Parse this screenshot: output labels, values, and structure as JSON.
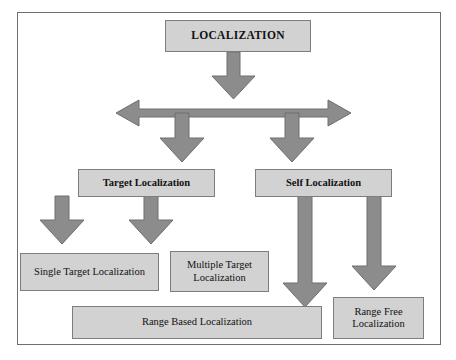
{
  "figure": {
    "frame_border_color": "#6f6f6f",
    "node_fill_color": "#d2d2d2",
    "node_border_color": "#7d7d7d",
    "arrow_fill_color": "#8c8c8c",
    "arrow_stroke_color": "#6e6e6e",
    "background_color": "#ffffff"
  },
  "nodes": {
    "root": {
      "label": "LOCALIZATION"
    },
    "target_localization": {
      "label": "Target Localization"
    },
    "self_localization": {
      "label": "Self Localization"
    },
    "single_target_localization": {
      "label": "Single Target Localization"
    },
    "multiple_target_localization": {
      "label": "Multiple Target\nLocalization"
    },
    "range_based_localization": {
      "label": "Range Based Localization"
    },
    "range_free_localization": {
      "label": "Range Free\nLocalization"
    }
  },
  "connectors": [
    {
      "name": "root-to-split",
      "from": "root",
      "to": "split-bar",
      "direction": "down"
    },
    {
      "name": "split-bar",
      "from": "split-bar-left",
      "to": "split-bar-right",
      "direction": "horizontal-double"
    },
    {
      "name": "split-to-target",
      "from": "split-bar",
      "to": "target_localization",
      "direction": "down"
    },
    {
      "name": "split-to-self",
      "from": "split-bar",
      "to": "self_localization",
      "direction": "down"
    },
    {
      "name": "target-to-single",
      "from": "target_localization",
      "to": "single_target_localization",
      "direction": "down"
    },
    {
      "name": "target-to-multiple",
      "from": "target_localization",
      "to": "multiple_target_localization",
      "direction": "down"
    },
    {
      "name": "self-to-range-based",
      "from": "self_localization",
      "to": "range_based_localization",
      "direction": "down"
    },
    {
      "name": "self-to-range-free",
      "from": "self_localization",
      "to": "range_free_localization",
      "direction": "down"
    }
  ]
}
